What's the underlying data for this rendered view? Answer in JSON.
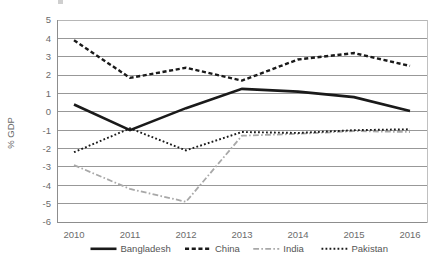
{
  "chart_data": {
    "type": "line",
    "title": "",
    "xlabel": "",
    "ylabel": "% GDP",
    "x": [
      2010,
      2011,
      2012,
      2013,
      2014,
      2015,
      2016
    ],
    "categories": [
      "2010",
      "2011",
      "2012",
      "2013",
      "2014",
      "2015",
      "2016"
    ],
    "xlim": [
      2010,
      2016
    ],
    "ylim": [
      -6,
      5
    ],
    "yticks": [
      5,
      4,
      3,
      2,
      1,
      0,
      -1,
      -2,
      -3,
      -4,
      -5,
      -6
    ],
    "ytick_labels": [
      "5",
      "4",
      "3",
      "2",
      "1",
      "0",
      "-1",
      "-2",
      "-3",
      "-4",
      "-5",
      "-6"
    ],
    "grid": true,
    "legend_position": "bottom",
    "series": [
      {
        "name": "Bangladesh",
        "style": "solid",
        "color": "#1a1a1a",
        "width": 2.6,
        "values": [
          0.4,
          -1.0,
          0.2,
          1.25,
          1.1,
          0.8,
          0.05
        ]
      },
      {
        "name": "China",
        "style": "dashed",
        "color": "#1a1a1a",
        "width": 2.4,
        "values": [
          3.9,
          1.85,
          2.4,
          1.7,
          2.85,
          3.2,
          2.5
        ]
      },
      {
        "name": "India",
        "style": "dashdot",
        "color": "#a8a8a8",
        "width": 1.8,
        "values": [
          -2.9,
          -4.2,
          -4.9,
          -1.3,
          -1.2,
          -1.05,
          -1.1
        ]
      },
      {
        "name": "Pakistan",
        "style": "dotted",
        "color": "#1a1a1a",
        "width": 1.9,
        "values": [
          -2.2,
          -0.9,
          -2.1,
          -1.1,
          -1.15,
          -1.0,
          -0.95
        ]
      }
    ]
  },
  "axis": {
    "ylabel": "% GDP"
  },
  "legend": {
    "items": [
      {
        "label": "Bangladesh"
      },
      {
        "label": "China"
      },
      {
        "label": "India"
      },
      {
        "label": "Pakistan"
      }
    ]
  }
}
